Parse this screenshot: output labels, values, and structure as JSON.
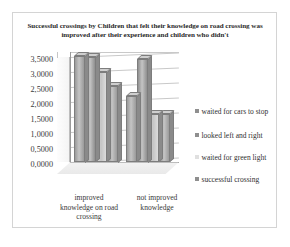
{
  "chart_data": {
    "type": "bar",
    "title": "Successful crossings by Children that felt their knowledge on road crossing was improved after their experience and children who didn't",
    "xlabel": "",
    "ylabel": "",
    "ylim": [
      0,
      3.5
    ],
    "grid": true,
    "legend_position": "right",
    "style": "3d-clustered-column",
    "categories": [
      "improved knowledge on road crossing",
      "not improved knowledge"
    ],
    "yticks": [
      "0,0000",
      "0,5000",
      "1,0000",
      "1,5000",
      "2,0000",
      "2,5000",
      "3,0000",
      "3,5000"
    ],
    "ytick_values": [
      0,
      0.5,
      1.0,
      1.5,
      2.0,
      2.5,
      3.0,
      3.5
    ],
    "series": [
      {
        "name": "waited for cars to stop",
        "color": "#9a9a9a",
        "values": [
          3.55,
          2.2
        ]
      },
      {
        "name": "looked left and right",
        "color": "#8f8f8f",
        "values": [
          3.5,
          3.45
        ]
      },
      {
        "name": "waited for green light",
        "color": "#dcdcdc",
        "values": [
          3.0,
          1.6
        ]
      },
      {
        "name": "successful crossing",
        "color": "#9a9a9a",
        "values": [
          2.55,
          1.6
        ]
      }
    ]
  },
  "legend": {
    "items": [
      {
        "label": "waited for cars to stop",
        "color": "#8f8f8f"
      },
      {
        "label": "looked left and right",
        "color": "#8f8f8f"
      },
      {
        "label": "waited for green light",
        "color": "#e0e0e0"
      },
      {
        "label": "successful crossing",
        "color": "#8f8f8f"
      }
    ]
  }
}
